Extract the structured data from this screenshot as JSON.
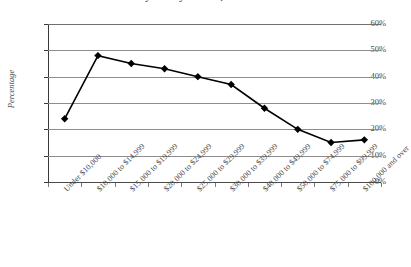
{
  "chart_data": {
    "type": "line",
    "title": "by Family Income, 2009",
    "xlabel": "",
    "ylabel": "Percentage",
    "ylim": [
      0,
      60
    ],
    "grid": true,
    "legend": "none",
    "marker": "diamond",
    "series_color": "#000000",
    "grid_color": "#8d8d8d",
    "categories": [
      "Under $10,000",
      "$10,000 to $14,999",
      "$15,000 to $19,999",
      "$20,000 to $24,999",
      "$25,000 to $29,999",
      "$30,000 to $39,999",
      "$40,000 to $49,999",
      "$50,000 to $74,999",
      "$75,000 to $99,999",
      "$100,000 and over"
    ],
    "values": [
      24,
      48,
      45,
      43,
      40,
      37,
      28,
      20,
      15,
      16
    ],
    "yticks": [
      0,
      10,
      20,
      30,
      40,
      50,
      60
    ],
    "ytick_labels": [
      "0%",
      "10%",
      "20%",
      "30%",
      "40%",
      "50%",
      "60%"
    ]
  }
}
